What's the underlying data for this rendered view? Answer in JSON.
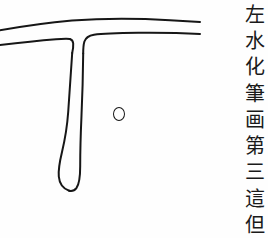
{
  "page": {
    "background_color": "#fefefe",
    "ink_color": "#161616",
    "width": 268,
    "height": 238
  },
  "diagram": {
    "name": "brush-stroke-outline",
    "strokes": [
      {
        "name": "horizontal-stroke",
        "label": "heng",
        "direction": "left-to-right",
        "start_x": 0,
        "end_x": 200,
        "top_y": 22,
        "bottom_y": 42
      },
      {
        "name": "vertical-stroke",
        "label": "shu",
        "direction": "top-to-bottom",
        "x": 72,
        "start_y": 40,
        "end_y": 192,
        "tip": "rounded-bulge"
      }
    ]
  },
  "annotation": {
    "name": "reference-dot",
    "shape": "circle",
    "cx": 119,
    "cy": 113,
    "radius": 6,
    "filled": false
  },
  "caption": {
    "orientation": "vertical",
    "reading_direction": "top-to-bottom",
    "characters": [
      "左",
      "水",
      "化",
      "筆",
      "画",
      "第",
      "三",
      "這",
      "但"
    ],
    "text": "左水化筆画第三這但"
  }
}
